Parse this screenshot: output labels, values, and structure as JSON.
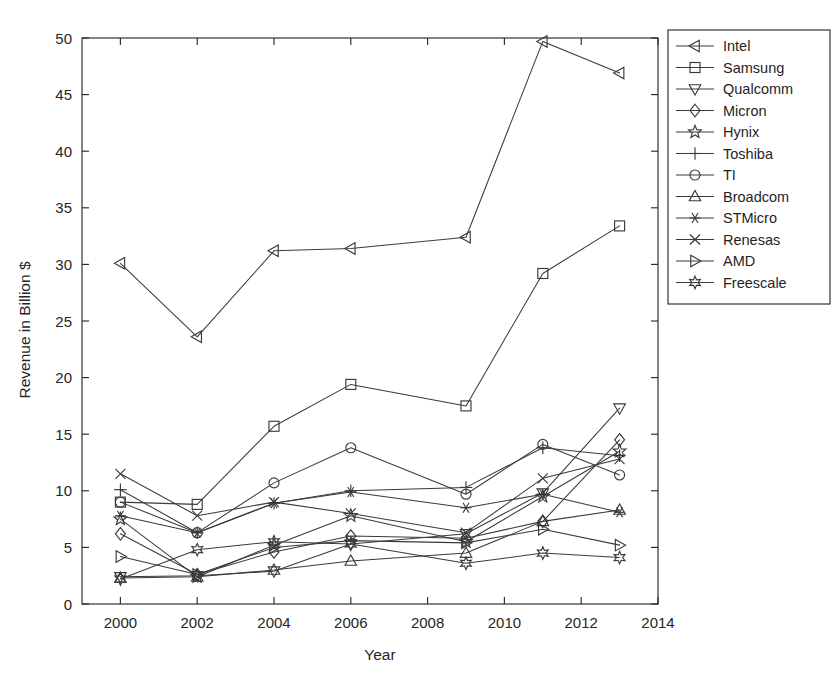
{
  "chart_data": {
    "type": "line",
    "title": "",
    "xlabel": "Year",
    "ylabel": "Revenue in Billion $",
    "x": [
      2000,
      2002,
      2004,
      2006,
      2009,
      2011,
      2013
    ],
    "xlim": [
      1999,
      2014
    ],
    "ylim": [
      0,
      50
    ],
    "xticks": [
      2000,
      2002,
      2004,
      2006,
      2008,
      2010,
      2012,
      2014
    ],
    "xticklabels": [
      "2000",
      "2002",
      "2004",
      "2006",
      "2008",
      "2010",
      "2012",
      "2014"
    ],
    "yticks": [
      0,
      5,
      10,
      15,
      20,
      25,
      30,
      35,
      40,
      45,
      50
    ],
    "yticklabels": [
      "0",
      "5",
      "10",
      "15",
      "20",
      "25",
      "30",
      "35",
      "40",
      "45",
      "50"
    ],
    "grid": false,
    "legend_position": "right-outside",
    "series": [
      {
        "name": "Intel",
        "marker": "triangle-left",
        "values": [
          30.1,
          23.6,
          31.2,
          31.4,
          32.4,
          49.7,
          46.9
        ]
      },
      {
        "name": "Samsung",
        "marker": "square",
        "values": [
          9.0,
          8.8,
          15.7,
          19.4,
          17.5,
          29.2,
          33.4
        ]
      },
      {
        "name": "Qualcomm",
        "marker": "triangle-down",
        "values": [
          2.4,
          2.5,
          2.9,
          5.3,
          6.2,
          9.8,
          17.3
        ]
      },
      {
        "name": "Micron",
        "marker": "diamond",
        "values": [
          6.2,
          2.6,
          4.6,
          6.0,
          5.8,
          7.3,
          14.5
        ]
      },
      {
        "name": "Hynix",
        "marker": "star-5",
        "values": [
          7.5,
          2.4,
          5.2,
          7.8,
          5.5,
          9.5,
          13.5
        ]
      },
      {
        "name": "Toshiba",
        "marker": "plus",
        "values": [
          10.1,
          6.3,
          8.9,
          10.0,
          10.3,
          13.8,
          13.1
        ]
      },
      {
        "name": "TI",
        "marker": "circle",
        "values": [
          9.0,
          6.3,
          10.7,
          13.8,
          9.7,
          14.1,
          11.4
        ]
      },
      {
        "name": "Broadcom",
        "marker": "triangle-up",
        "values": [
          2.3,
          2.4,
          3.0,
          3.8,
          4.5,
          7.3,
          8.3
        ]
      },
      {
        "name": "STMicro",
        "marker": "asterisk",
        "values": [
          7.8,
          6.3,
          8.9,
          9.9,
          8.5,
          9.7,
          8.1
        ]
      },
      {
        "name": "Renesas",
        "marker": "cross",
        "values": [
          11.5,
          7.8,
          9.0,
          8.0,
          6.3,
          11.1,
          12.8
        ]
      },
      {
        "name": "AMD",
        "marker": "triangle-right",
        "values": [
          4.2,
          2.6,
          5.0,
          5.6,
          5.4,
          6.6,
          5.2
        ]
      },
      {
        "name": "Freescale",
        "marker": "hexagram",
        "values": [
          2.2,
          4.8,
          5.5,
          5.3,
          3.6,
          4.5,
          4.1
        ]
      }
    ]
  },
  "legend": {
    "entries": [
      {
        "label": "Intel"
      },
      {
        "label": "Samsung"
      },
      {
        "label": "Qualcomm"
      },
      {
        "label": "Micron"
      },
      {
        "label": "Hynix"
      },
      {
        "label": "Toshiba"
      },
      {
        "label": "TI"
      },
      {
        "label": "Broadcom"
      },
      {
        "label": "STMicro"
      },
      {
        "label": "Renesas"
      },
      {
        "label": "AMD"
      },
      {
        "label": "Freescale"
      }
    ]
  },
  "colors": {
    "line": "#3a3a3a",
    "axis": "#2b2b2b",
    "text": "#262626",
    "background": "#ffffff"
  }
}
